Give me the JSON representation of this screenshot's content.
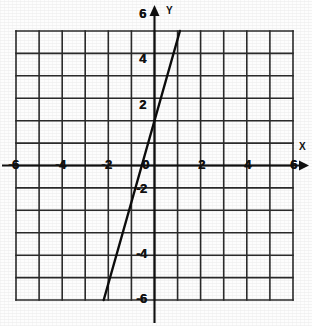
{
  "chart_data": {
    "type": "line",
    "title": "",
    "subtitle": "",
    "xlabel": "X",
    "ylabel": "Y",
    "xlim": [
      -6,
      6
    ],
    "ylim": [
      -6,
      6
    ],
    "grid": true,
    "grid_step": 1,
    "legend": "none",
    "x_ticks": [
      -6,
      -4,
      -2,
      0,
      2,
      4,
      6
    ],
    "y_ticks": [
      -6,
      -4,
      -2,
      0,
      2,
      4,
      6
    ],
    "x_tick_labels": [
      "-6",
      "-4",
      "-2",
      "0",
      "2",
      "4",
      "6"
    ],
    "y_tick_labels": [
      "-6",
      "-4",
      "-2",
      "2",
      "4",
      "6"
    ],
    "origin_label": "0",
    "series": [
      {
        "name": "line",
        "type": "line",
        "slope": 3.64,
        "intercept": 2.8,
        "x_intercept": -0.77,
        "points": [
          {
            "x": -2.2,
            "y": -6
          },
          {
            "x": -0.77,
            "y": 0
          },
          {
            "x": 1.1,
            "y": 6
          }
        ]
      }
    ],
    "annotations": [
      {
        "name": "x-axis-arrow",
        "at": [
          6.4,
          0
        ],
        "direction": "right"
      },
      {
        "name": "y-axis-arrow",
        "at": [
          0,
          6.6
        ],
        "direction": "up"
      }
    ]
  },
  "axes": {
    "x_name": "X",
    "y_name": "Y"
  },
  "ticks": {
    "x": [
      {
        "id": "x-neg-6",
        "label": "-6",
        "value": -6
      },
      {
        "id": "x-neg-4",
        "label": "-4",
        "value": -4
      },
      {
        "id": "x-neg-2",
        "label": "-2",
        "value": -2
      },
      {
        "id": "x-origin",
        "label": "0",
        "value": 0
      },
      {
        "id": "x-pos-2",
        "label": "2",
        "value": 2
      },
      {
        "id": "x-pos-4",
        "label": "4",
        "value": 4
      },
      {
        "id": "x-pos-6",
        "label": "6",
        "value": 6
      }
    ],
    "y": [
      {
        "id": "y-pos-6",
        "label": "6",
        "value": 6
      },
      {
        "id": "y-pos-4",
        "label": "4",
        "value": 4
      },
      {
        "id": "y-pos-2",
        "label": "2",
        "value": 2
      },
      {
        "id": "y-neg-2",
        "label": "-2",
        "value": -2
      },
      {
        "id": "y-neg-4",
        "label": "-4",
        "value": -4
      },
      {
        "id": "y-neg-6",
        "label": "-6",
        "value": -6
      }
    ]
  },
  "colors": {
    "grid": "#2b2b2b",
    "axis": "#101010",
    "line": "#0d0d0d",
    "background": "#fdfdfd",
    "text": "#111111"
  }
}
